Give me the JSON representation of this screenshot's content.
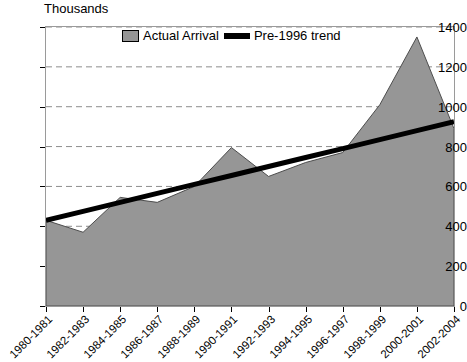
{
  "chart_data": {
    "type": "area",
    "title": "",
    "subtitle": "",
    "unit_label": "Thousands",
    "xlabel": "",
    "ylabel": "",
    "ylim": [
      0,
      1400
    ],
    "ytick_step": 200,
    "yticks": [
      0,
      200,
      400,
      600,
      800,
      1000,
      1200,
      1400
    ],
    "grid": true,
    "legend_position": "top-center-inside",
    "categories": [
      "1980-1981",
      "1982-1983",
      "1984-1985",
      "1986-1987",
      "1988-1989",
      "1990-1991",
      "1992-1993",
      "1994-1995",
      "1996-1997",
      "1998-1999",
      "2000-2001",
      "2002-2004"
    ],
    "series": [
      {
        "name": "Actual Arrival",
        "type": "area",
        "color": "#969696",
        "values": [
          430,
          370,
          545,
          520,
          600,
          795,
          650,
          720,
          770,
          1010,
          1350,
          890
        ]
      },
      {
        "name": "Pre-1996 trend",
        "type": "line",
        "color": "#000000",
        "values": [
          430,
          475,
          520,
          565,
          610,
          655,
          700,
          745,
          790,
          835,
          880,
          925
        ]
      }
    ],
    "legend": [
      {
        "label": "Actual Arrival",
        "marker": "area-swatch",
        "color": "#969696"
      },
      {
        "label": "Pre-1996 trend",
        "marker": "line-swatch",
        "color": "#000000"
      }
    ]
  }
}
